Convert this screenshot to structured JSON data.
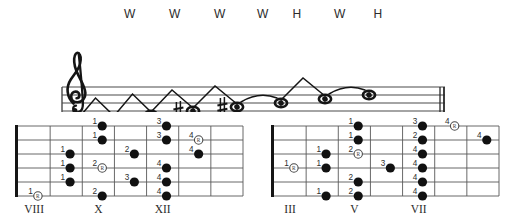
{
  "intervals": {
    "labels": [
      {
        "text": "W",
        "x": 130
      },
      {
        "text": "W",
        "x": 175
      },
      {
        "text": "W",
        "x": 220
      },
      {
        "text": "W",
        "x": 263
      },
      {
        "text": "H",
        "x": 297
      },
      {
        "text": "W",
        "x": 340
      },
      {
        "text": "H",
        "x": 378
      }
    ]
  },
  "staff": {
    "clef": "treble-clef",
    "line_count": 5,
    "barline": "double-barline",
    "notes": [
      {
        "index": 0,
        "x": 77,
        "y": 89,
        "accidental": "",
        "ledger": true,
        "label": "whole-note"
      },
      {
        "index": 1,
        "x": 114,
        "y": 85,
        "accidental": "",
        "ledger": false,
        "label": "whole-note"
      },
      {
        "index": 2,
        "x": 151,
        "y": 81,
        "accidental": "",
        "ledger": false,
        "label": "whole-note"
      },
      {
        "index": 3,
        "x": 193,
        "y": 77,
        "accidental": "sharp",
        "ledger": false,
        "label": "whole-note"
      },
      {
        "index": 4,
        "x": 237,
        "y": 73,
        "accidental": "sharp",
        "ledger": false,
        "label": "whole-note"
      },
      {
        "index": 5,
        "x": 281,
        "y": 69,
        "accidental": "",
        "ledger": false,
        "label": "whole-note"
      },
      {
        "index": 6,
        "x": 325,
        "y": 65,
        "accidental": "",
        "ledger": false,
        "label": "whole-note"
      },
      {
        "index": 7,
        "x": 369,
        "y": 61,
        "accidental": "",
        "ledger": false,
        "label": "whole-note"
      }
    ],
    "connectors": [
      {
        "type": "peak",
        "from": 0,
        "to": 1
      },
      {
        "type": "peak",
        "from": 1,
        "to": 2
      },
      {
        "type": "peak",
        "from": 2,
        "to": 3
      },
      {
        "type": "peak",
        "from": 3,
        "to": 4
      },
      {
        "type": "arc",
        "from": 4,
        "to": 5
      },
      {
        "type": "peak",
        "from": 5,
        "to": 6
      },
      {
        "type": "arc",
        "from": 6,
        "to": 7
      }
    ]
  },
  "fretboards": [
    {
      "name": "fretboard-left",
      "fret_labels": [
        {
          "text": "VIII",
          "col": 0
        },
        {
          "text": "X",
          "col": 2
        },
        {
          "text": "XII",
          "col": 4
        }
      ],
      "string_count": 6,
      "fret_count": 7,
      "dots": [
        {
          "finger": "1",
          "string": 5,
          "fret": 0,
          "root": true
        },
        {
          "finger": "1",
          "string": 2,
          "fret": 1,
          "root": false
        },
        {
          "finger": "1",
          "string": 3,
          "fret": 1,
          "root": false
        },
        {
          "finger": "1",
          "string": 4,
          "fret": 1,
          "root": false
        },
        {
          "finger": "1",
          "string": 0,
          "fret": 2,
          "root": false
        },
        {
          "finger": "1",
          "string": 1,
          "fret": 2,
          "root": false
        },
        {
          "finger": "2",
          "string": 3,
          "fret": 2,
          "root": true
        },
        {
          "finger": "2",
          "string": 5,
          "fret": 2,
          "root": false
        },
        {
          "finger": "2",
          "string": 2,
          "fret": 3,
          "root": false
        },
        {
          "finger": "3",
          "string": 4,
          "fret": 3,
          "root": false
        },
        {
          "finger": "3",
          "string": 0,
          "fret": 4,
          "root": false
        },
        {
          "finger": "3",
          "string": 1,
          "fret": 4,
          "root": false
        },
        {
          "finger": "4",
          "string": 3,
          "fret": 4,
          "root": false
        },
        {
          "finger": "4",
          "string": 4,
          "fret": 4,
          "root": false
        },
        {
          "finger": "4",
          "string": 5,
          "fret": 4,
          "root": false
        },
        {
          "finger": "4",
          "string": 1,
          "fret": 5,
          "root": true
        },
        {
          "finger": "4",
          "string": 2,
          "fret": 5,
          "root": false
        }
      ]
    },
    {
      "name": "fretboard-right",
      "fret_labels": [
        {
          "text": "III",
          "col": 0
        },
        {
          "text": "V",
          "col": 2
        },
        {
          "text": "VII",
          "col": 4
        }
      ],
      "string_count": 6,
      "fret_count": 7,
      "dots": [
        {
          "finger": "1",
          "string": 3,
          "fret": 0,
          "root": true
        },
        {
          "finger": "1",
          "string": 2,
          "fret": 1,
          "root": false
        },
        {
          "finger": "1",
          "string": 3,
          "fret": 1,
          "root": false
        },
        {
          "finger": "1",
          "string": 5,
          "fret": 1,
          "root": false
        },
        {
          "finger": "1",
          "string": 0,
          "fret": 2,
          "root": false
        },
        {
          "finger": "1",
          "string": 1,
          "fret": 2,
          "root": false
        },
        {
          "finger": "2",
          "string": 2,
          "fret": 2,
          "root": true
        },
        {
          "finger": "2",
          "string": 4,
          "fret": 2,
          "root": false
        },
        {
          "finger": "2",
          "string": 5,
          "fret": 2,
          "root": false
        },
        {
          "finger": "3",
          "string": 3,
          "fret": 3,
          "root": false
        },
        {
          "finger": "3",
          "string": 0,
          "fret": 4,
          "root": false
        },
        {
          "finger": "2",
          "string": 1,
          "fret": 4,
          "root": false
        },
        {
          "finger": "4",
          "string": 2,
          "fret": 4,
          "root": false
        },
        {
          "finger": "4",
          "string": 3,
          "fret": 4,
          "root": false
        },
        {
          "finger": "4",
          "string": 4,
          "fret": 4,
          "root": false
        },
        {
          "finger": "4",
          "string": 5,
          "fret": 4,
          "root": false
        },
        {
          "finger": "4",
          "string": 0,
          "fret": 5,
          "root": true
        },
        {
          "finger": "4",
          "string": 1,
          "fret": 6,
          "root": false
        }
      ]
    }
  ],
  "colors": {
    "ink": "#1a1a1a",
    "staff_line": "#4a4a4a",
    "dot_fill": "#111111",
    "label_gray": "#555555"
  }
}
